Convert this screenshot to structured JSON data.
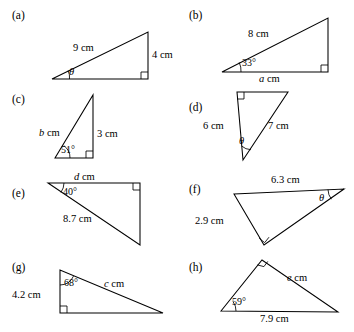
{
  "sheet": {
    "background": "#ffffff",
    "ink": "#000000"
  },
  "panels": [
    {
      "key": "a",
      "label": "(a)",
      "shape": "right-triangle",
      "right_angle_vertex": "bottom-right",
      "labels": {
        "hypotenuse": "9 cm",
        "vertical": "4 cm",
        "angle": "θ"
      }
    },
    {
      "key": "b",
      "label": "(b)",
      "shape": "right-triangle",
      "right_angle_vertex": "bottom-right",
      "labels": {
        "hypotenuse": "8 cm",
        "base": "a cm",
        "base_var": "a",
        "base_unit": " cm",
        "angle": "33°"
      }
    },
    {
      "key": "c",
      "label": "(c)",
      "shape": "right-triangle",
      "right_angle_vertex": "bottom-right",
      "labels": {
        "hypotenuse": "b cm",
        "hyp_var": "b",
        "hyp_unit": " cm",
        "vertical": "3 cm",
        "angle": "51°"
      }
    },
    {
      "key": "d",
      "label": "(d)",
      "shape": "right-triangle",
      "right_angle_vertex": "top-left",
      "labels": {
        "vertical": "6 cm",
        "hypotenuse": "7 cm",
        "angle": "θ"
      }
    },
    {
      "key": "e",
      "label": "(e)",
      "shape": "right-triangle",
      "right_angle_vertex": "top-right",
      "labels": {
        "top": "d cm",
        "top_var": "d",
        "top_unit": " cm",
        "hypotenuse": "8.7 cm",
        "angle": "40°"
      }
    },
    {
      "key": "f",
      "label": "(f)",
      "shape": "right-triangle",
      "right_angle_vertex": "bottom",
      "labels": {
        "top": "6.3 cm",
        "left": "2.9 cm",
        "angle": "θ"
      }
    },
    {
      "key": "g",
      "label": "(g)",
      "shape": "right-triangle",
      "right_angle_vertex": "bottom-left",
      "labels": {
        "vertical": "4.2 cm",
        "hypotenuse": "c cm",
        "hyp_var": "c",
        "hyp_unit": " cm",
        "angle": "68°"
      }
    },
    {
      "key": "h",
      "label": "(h)",
      "shape": "right-triangle",
      "right_angle_vertex": "apex",
      "labels": {
        "right": "e cm",
        "right_var": "e",
        "right_unit": " cm",
        "base": "7.9 cm",
        "angle": "59°"
      }
    }
  ]
}
